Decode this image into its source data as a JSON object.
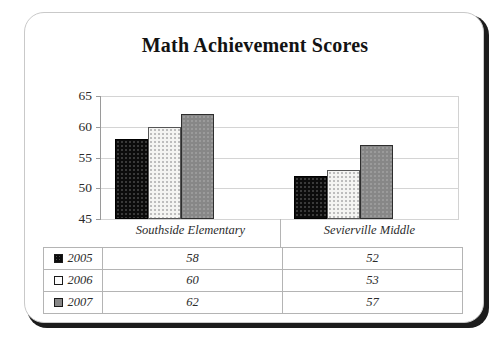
{
  "card": {
    "title": "Math Achievement Scores"
  },
  "chart_data": {
    "type": "bar",
    "title": "Math Achievement Scores",
    "xlabel": "",
    "ylabel": "",
    "ylim": [
      45,
      65
    ],
    "yticks": [
      45,
      50,
      55,
      60,
      65
    ],
    "grid": true,
    "legend_position": "table-below",
    "categories": [
      "Southside Elementary",
      "Sevierville Middle"
    ],
    "series": [
      {
        "name": "2005",
        "color": "#0c0c0c",
        "values": [
          58,
          52
        ]
      },
      {
        "name": "2006",
        "color": "#f4f4f2",
        "values": [
          60,
          53
        ]
      },
      {
        "name": "2007",
        "color": "#878787",
        "values": [
          62,
          57
        ]
      }
    ]
  },
  "table": {
    "column_headers": [
      "Southside Elementary",
      "Sevierville Middle"
    ],
    "rows": [
      {
        "label": "2005",
        "swatch": "black-swatch-icon",
        "values": [
          "58",
          "52"
        ]
      },
      {
        "label": "2006",
        "swatch": "white-swatch-icon",
        "values": [
          "60",
          "53"
        ]
      },
      {
        "label": "2007",
        "swatch": "gray-swatch-icon",
        "values": [
          "62",
          "57"
        ]
      }
    ]
  },
  "axis": {
    "tick_labels": [
      "65",
      "60",
      "55",
      "50",
      "45"
    ]
  },
  "colors": {
    "series_2005": "#0c0c0c",
    "series_2006": "#f4f4f2",
    "series_2007": "#878787",
    "gridline": "#d4d4d4",
    "border": "#b4b4b4"
  }
}
